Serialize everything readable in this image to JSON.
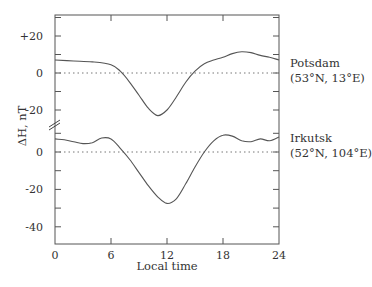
{
  "chart_data": {
    "type": "line",
    "title": "",
    "xlabel": "Local time",
    "ylabel": "ΔH, nT",
    "xlim": [
      0,
      24
    ],
    "x_ticks": [
      0,
      6,
      12,
      18,
      24
    ],
    "x_tick_labels": [
      "0",
      "6",
      "12",
      "18",
      "24"
    ],
    "grid": false,
    "legend": "inline labels at right",
    "panels": [
      {
        "name": "Potsdam",
        "label_line1": "Potsdam",
        "label_line2": "(53°N, 13°E)",
        "y_ticks": [
          20,
          0,
          -20
        ],
        "y_tick_labels": [
          "+20",
          "0",
          "-20"
        ],
        "baseline": 0,
        "x": [
          0,
          2,
          4,
          6,
          7,
          8,
          9,
          10,
          11,
          12,
          13,
          14,
          15,
          16,
          17,
          18,
          19,
          20,
          21,
          22,
          23,
          24
        ],
        "values": [
          7,
          6.5,
          6,
          4.5,
          1,
          -5,
          -12,
          -19,
          -23,
          -20,
          -13,
          -5,
          1,
          5,
          7,
          8.5,
          10.5,
          11.5,
          11,
          9.5,
          8.5,
          7
        ]
      },
      {
        "name": "Irkutsk",
        "label_line1": "Irkutsk",
        "label_line2": "(52°N, 104°E)",
        "y_ticks": [
          0,
          -20,
          -40
        ],
        "y_tick_labels": [
          "0",
          "-20",
          "-40"
        ],
        "baseline": 0,
        "x": [
          0,
          1,
          2,
          3,
          4,
          5,
          6,
          7,
          8,
          9,
          10,
          11,
          12,
          13,
          14,
          15,
          16,
          17,
          18,
          19,
          20,
          21,
          22,
          23,
          24
        ],
        "values": [
          7,
          6.5,
          5.5,
          4.5,
          5,
          7.5,
          7,
          2,
          -4,
          -11,
          -18,
          -24,
          -27.5,
          -25,
          -17,
          -8,
          0,
          6,
          9,
          8.5,
          6,
          5.5,
          7,
          6,
          8
        ]
      }
    ],
    "axis_break": "//"
  }
}
